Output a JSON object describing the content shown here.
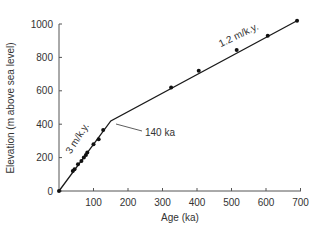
{
  "chart_data": {
    "type": "scatter",
    "title": "",
    "xlabel": "Age (ka)",
    "ylabel": "Elevation (m above sea level)",
    "xlim": [
      0,
      700
    ],
    "ylim": [
      0,
      1000
    ],
    "x_ticks": [
      100,
      200,
      300,
      400,
      500,
      600,
      700
    ],
    "y_ticks": [
      0,
      200,
      400,
      600,
      800,
      1000
    ],
    "grid": false,
    "legend": null,
    "series": [
      {
        "name": "Terrace data points",
        "type": "scatter",
        "points": [
          {
            "x": 0,
            "y": 0
          },
          {
            "x": 40,
            "y": 120
          },
          {
            "x": 45,
            "y": 130
          },
          {
            "x": 55,
            "y": 160
          },
          {
            "x": 65,
            "y": 180
          },
          {
            "x": 72,
            "y": 200
          },
          {
            "x": 78,
            "y": 215
          },
          {
            "x": 82,
            "y": 230
          },
          {
            "x": 100,
            "y": 280
          },
          {
            "x": 115,
            "y": 310
          },
          {
            "x": 128,
            "y": 365
          },
          {
            "x": 325,
            "y": 620
          },
          {
            "x": 405,
            "y": 720
          },
          {
            "x": 515,
            "y": 845
          },
          {
            "x": 605,
            "y": 930
          },
          {
            "x": 690,
            "y": 1020
          }
        ]
      },
      {
        "name": "Uplift rate fit",
        "type": "line",
        "points": [
          {
            "x": 0,
            "y": 0
          },
          {
            "x": 150,
            "y": 420
          },
          {
            "x": 690,
            "y": 1020
          }
        ]
      }
    ],
    "annotations": [
      {
        "text": "3 m/k.y.",
        "segment": "lower",
        "rotation": -55
      },
      {
        "text": "1.2 m/k.y.",
        "segment": "upper",
        "rotation": -26
      },
      {
        "text": "140 ka",
        "points_to": {
          "x": 150,
          "y": 420
        }
      }
    ]
  },
  "labels": {
    "xlabel": "Age (ka)",
    "ylabel": "Elevation (m above sea level)",
    "x_ticks": [
      "100",
      "200",
      "300",
      "400",
      "500",
      "600",
      "700"
    ],
    "y_ticks": [
      "0",
      "200",
      "400",
      "600",
      "800",
      "1000"
    ],
    "rate_lower": "3 m/k.y.",
    "rate_upper": "1.2 m/k.y.",
    "break_label": "140 ka"
  },
  "colors": {
    "axis": "#555555",
    "line": "#1a1a1a",
    "points": "#111111",
    "text": "#333333"
  }
}
